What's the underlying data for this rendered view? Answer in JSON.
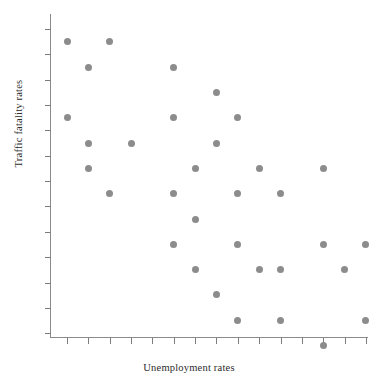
{
  "chart_data": {
    "type": "scatter",
    "title": "",
    "xlabel": "Unemployment rates",
    "ylabel": "Traffic fatality rates",
    "grid": false,
    "legend": null,
    "axis": {
      "x_tick_count": 15,
      "y_tick_count": 13,
      "x_tick_labels": [],
      "y_tick_labels": [],
      "xlim": [
        0,
        15
      ],
      "ylim": [
        0,
        13
      ],
      "note": "Axes are unlabeled; ticks mark a uniform lattice on which all points fall."
    },
    "marker": {
      "shape": "circle",
      "color": "#8c8c8c",
      "size_px": 7
    },
    "n_points": 36,
    "relationship": "negative",
    "points": [
      {
        "x": 1,
        "y": 11
      },
      {
        "x": 3,
        "y": 11
      },
      {
        "x": 2,
        "y": 10
      },
      {
        "x": 6,
        "y": 10
      },
      {
        "x": 8,
        "y": 9
      },
      {
        "x": 1,
        "y": 8
      },
      {
        "x": 6,
        "y": 8
      },
      {
        "x": 9,
        "y": 8
      },
      {
        "x": 2,
        "y": 7
      },
      {
        "x": 4,
        "y": 7
      },
      {
        "x": 8,
        "y": 7
      },
      {
        "x": 2,
        "y": 6
      },
      {
        "x": 7,
        "y": 6
      },
      {
        "x": 10,
        "y": 6
      },
      {
        "x": 13,
        "y": 6
      },
      {
        "x": 3,
        "y": 5
      },
      {
        "x": 6,
        "y": 5
      },
      {
        "x": 9,
        "y": 5
      },
      {
        "x": 11,
        "y": 5
      },
      {
        "x": 7,
        "y": 4
      },
      {
        "x": 6,
        "y": 3
      },
      {
        "x": 9,
        "y": 3
      },
      {
        "x": 13,
        "y": 3
      },
      {
        "x": 15,
        "y": 3
      },
      {
        "x": 7,
        "y": 2
      },
      {
        "x": 10,
        "y": 2
      },
      {
        "x": 11,
        "y": 2
      },
      {
        "x": 14,
        "y": 2
      },
      {
        "x": 8,
        "y": 1
      },
      {
        "x": 16,
        "y": 1
      },
      {
        "x": 9,
        "y": 0
      },
      {
        "x": 11,
        "y": 0
      },
      {
        "x": 15,
        "y": 0
      },
      {
        "x": 13,
        "y": -1
      }
    ]
  },
  "labels": {
    "x_axis": "Unemployment rates",
    "y_axis": "Traffic fatality rates"
  }
}
